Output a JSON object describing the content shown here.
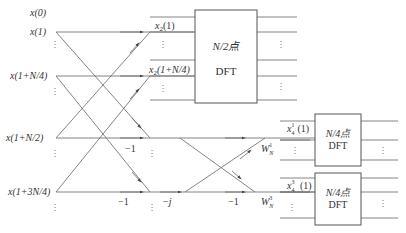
{
  "diagram": {
    "type": "FFT butterfly flow graph (radix-2 decimation-in-frequency, partial)",
    "inputs": [
      {
        "label": "x(0)"
      },
      {
        "label": "x(1)"
      },
      {
        "label": "x(1+N/4)"
      },
      {
        "label": "x(1+N/2)"
      },
      {
        "label": "x(1+3N/4)"
      }
    ],
    "stage1_outputs": [
      {
        "base": "x",
        "sub": "2",
        "arg": "(1)"
      },
      {
        "base": "x",
        "sub": "2",
        "arg": "(1+N/4)"
      }
    ],
    "multipliers": {
      "m1": "−1",
      "m2": "−1",
      "m3": "−j",
      "m4": "−1"
    },
    "twiddles": [
      {
        "base": "W",
        "sub": "N",
        "sup": "1"
      },
      {
        "base": "W",
        "sub": "N",
        "sup": "3"
      }
    ],
    "stage2_outputs": [
      {
        "base": "x",
        "sub": "4",
        "sup": "1",
        "arg": "(1)"
      },
      {
        "base": "x",
        "sub": "4",
        "sup": "3",
        "arg": " (1)"
      }
    ],
    "blocks": [
      {
        "line1": "N/2点",
        "line2": "DFT"
      },
      {
        "line1": "N/4点",
        "line2": "DFT"
      },
      {
        "line1": "N/4点",
        "line2": "DFT"
      }
    ],
    "ellipsis": "⋮"
  }
}
